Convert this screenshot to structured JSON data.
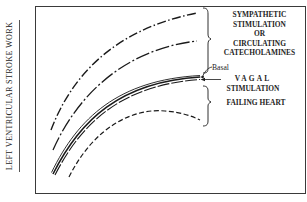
{
  "figure": {
    "y_axis_label": "LEFT VENTRICULAR STROKE WORK",
    "x_axis_label": "",
    "annotations": {
      "sympathetic_lines": [
        "SYMPATHETIC",
        "STIMULATION",
        "OR",
        "CIRCULATING",
        "CATECHOLAMINES"
      ],
      "basal": "Basal",
      "vagal_line1": "VAGAL",
      "vagal_line2": "STIMULATION",
      "failing_heart": "FAILING HEART"
    },
    "curves": [
      {
        "name": "sympathetic-high",
        "style": "dash-dot",
        "color": "#1a1a1a"
      },
      {
        "name": "sympathetic-moderate",
        "style": "dash-dot",
        "color": "#1a1a1a"
      },
      {
        "name": "basal",
        "style": "solid",
        "color": "#1a1a1a"
      },
      {
        "name": "vagal-stimulation",
        "style": "dashed",
        "color": "#1a1a1a"
      },
      {
        "name": "failing-heart",
        "style": "dashed",
        "color": "#1a1a1a"
      }
    ],
    "colors": {
      "line": "#1a1a1a",
      "frame": "#3a3a3a",
      "background": "#ffffff"
    }
  }
}
